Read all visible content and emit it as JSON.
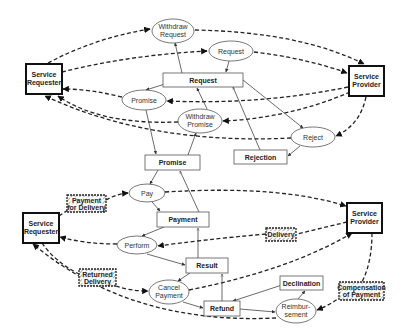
{
  "diagram": {
    "actors": [
      {
        "id": "sr1",
        "label": [
          "Service",
          "Requester"
        ],
        "x": 26,
        "y": 64,
        "w": 36,
        "h": 30
      },
      {
        "id": "sp1",
        "label": [
          "Service",
          "Provider"
        ],
        "x": 349,
        "y": 66,
        "w": 35,
        "h": 30
      },
      {
        "id": "sr2",
        "label": [
          "Service",
          "Requester"
        ],
        "x": 23,
        "y": 213,
        "w": 36,
        "h": 30
      },
      {
        "id": "sp2",
        "label": [
          "Service",
          "Provider"
        ],
        "x": 347,
        "y": 203,
        "w": 35,
        "h": 30
      }
    ],
    "states": [
      {
        "id": "request_box",
        "label": "Request",
        "x": 163,
        "y": 73,
        "w": 80,
        "h": 14
      },
      {
        "id": "rejection_box",
        "label": "Rejection",
        "x": 234,
        "y": 150,
        "w": 53,
        "h": 14
      },
      {
        "id": "promise_box",
        "label": "Promise",
        "x": 145,
        "y": 155,
        "w": 55,
        "h": 15
      },
      {
        "id": "payment_box",
        "label": "Payment",
        "x": 157,
        "y": 212,
        "w": 52,
        "h": 15
      },
      {
        "id": "result_box",
        "label": "Result",
        "x": 186,
        "y": 258,
        "w": 42,
        "h": 15
      },
      {
        "id": "refund_box",
        "label": "Refund",
        "x": 204,
        "y": 301,
        "w": 36,
        "h": 15
      },
      {
        "id": "declination_box",
        "label": "Declination",
        "x": 280,
        "y": 276,
        "w": 43,
        "h": 14
      }
    ],
    "actions": [
      {
        "id": "withdraw_request",
        "label": [
          "Withdraw",
          "Request"
        ],
        "cx": 173,
        "cy": 31,
        "rx": 21,
        "ry": 12
      },
      {
        "id": "request",
        "label": [
          "Request"
        ],
        "cx": 231,
        "cy": 51,
        "rx": 22,
        "ry": 10
      },
      {
        "id": "promise",
        "label": [
          "Promise"
        ],
        "cx": 144,
        "cy": 100,
        "rx": 22,
        "ry": 10
      },
      {
        "id": "withdraw_promise",
        "label": [
          "Withdraw",
          "Promise"
        ],
        "cx": 200,
        "cy": 121,
        "rx": 22,
        "ry": 12
      },
      {
        "id": "reject",
        "label": [
          "Reject"
        ],
        "cx": 313,
        "cy": 137,
        "rx": 22,
        "ry": 10
      },
      {
        "id": "pay",
        "label": [
          "Pay"
        ],
        "cx": 147,
        "cy": 193,
        "rx": 18,
        "ry": 9
      },
      {
        "id": "perform",
        "label": [
          "Perform"
        ],
        "cx": 137,
        "cy": 245,
        "rx": 20,
        "ry": 9
      },
      {
        "id": "cancel_payment",
        "label": [
          "Cancel",
          "Payment"
        ],
        "cx": 169,
        "cy": 292,
        "rx": 20,
        "ry": 12
      },
      {
        "id": "reimbursement",
        "label": [
          "Reimbur-",
          "sement"
        ],
        "cx": 296,
        "cy": 311,
        "rx": 20,
        "ry": 12
      }
    ],
    "objects": [
      {
        "id": "payment_for_delivery",
        "label": [
          "Payment",
          "for Delivery"
        ],
        "x": 67,
        "y": 195,
        "w": 39,
        "h": 17
      },
      {
        "id": "delivery",
        "label": [
          "Delivery"
        ],
        "x": 266,
        "y": 228,
        "w": 30,
        "h": 13
      },
      {
        "id": "returned_delivery",
        "label": [
          "Returned",
          "Delivery"
        ],
        "x": 79,
        "y": 269,
        "w": 37,
        "h": 17
      },
      {
        "id": "compensation_of_payment",
        "label": [
          "Compensation",
          "of Payment"
        ],
        "x": 339,
        "y": 282,
        "w": 45,
        "h": 18
      }
    ]
  }
}
